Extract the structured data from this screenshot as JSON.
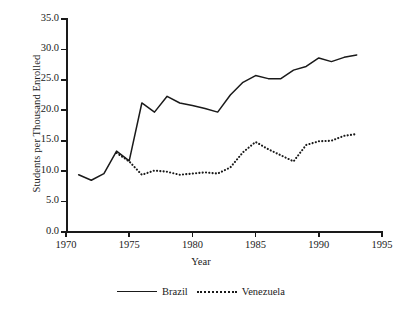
{
  "chart_data": {
    "type": "line",
    "title": "",
    "xlabel": "Year",
    "ylabel": "Students per Thousand Enrolled",
    "xlim": [
      1970,
      1995
    ],
    "ylim": [
      0.0,
      35.0
    ],
    "xticks": [
      "1970",
      "1975",
      "1980",
      "1985",
      "1990",
      "1995"
    ],
    "yticks": [
      "0.0",
      "5.0",
      "10.0",
      "15.0",
      "20.0",
      "25.0",
      "30.0",
      "35.0"
    ],
    "grid": false,
    "legend_position": "below",
    "series": [
      {
        "name": "Brazil",
        "style": "solid",
        "color": "#1a1a1a",
        "x": [
          1971,
          1972,
          1973,
          1974,
          1975,
          1976,
          1977,
          1978,
          1979,
          1980,
          1981,
          1982,
          1983,
          1984,
          1985,
          1986,
          1987,
          1988,
          1989,
          1990,
          1991,
          1992,
          1993
        ],
        "values": [
          9.4,
          8.5,
          9.6,
          13.3,
          11.7,
          21.2,
          19.7,
          22.3,
          21.2,
          20.8,
          20.3,
          19.7,
          22.5,
          24.6,
          25.7,
          25.2,
          25.2,
          26.6,
          27.2,
          28.6,
          28.0,
          28.7,
          29.1
        ]
      },
      {
        "name": "Venezuela",
        "style": "dotted",
        "color": "#1a1a1a",
        "x": [
          1974,
          1975,
          1976,
          1977,
          1978,
          1979,
          1980,
          1981,
          1982,
          1983,
          1984,
          1985,
          1986,
          1987,
          1988,
          1989,
          1990,
          1991,
          1992,
          1993
        ],
        "values": [
          13.0,
          11.6,
          9.4,
          10.1,
          9.9,
          9.4,
          9.6,
          9.8,
          9.6,
          10.6,
          13.1,
          14.8,
          13.6,
          12.6,
          11.6,
          14.3,
          14.9,
          15.0,
          15.8,
          16.1
        ]
      }
    ]
  }
}
